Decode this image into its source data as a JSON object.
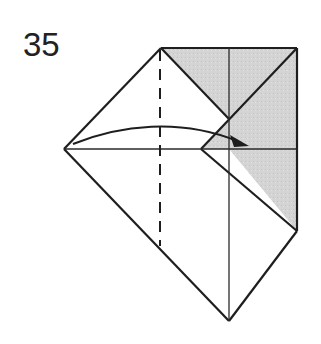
{
  "step": {
    "number": "35"
  },
  "diagram": {
    "type": "origami-fold-step",
    "colors": {
      "paper_white": "#ffffff",
      "paper_shaded": "#d6d6d6",
      "line": "#1e1e1e"
    },
    "elements": [
      "shaded colored-side region (top-right)",
      "valley fold dashed line (vertical)",
      "curved arrow indicating fold from left point to right"
    ]
  }
}
